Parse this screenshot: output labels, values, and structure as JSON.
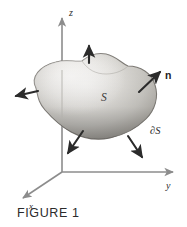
{
  "figure": {
    "caption": "FIGURE 1",
    "background_color": "#ffffff",
    "ink_color": "#2b2b2b",
    "axis_color": "#8c8c8c",
    "surface_fill_light": "#f0efec",
    "surface_fill_mid": "#c9c7c2",
    "surface_fill_dark": "#9a9791",
    "surface_edge": "#7d7a75"
  },
  "axes": {
    "origin": {
      "x": 62,
      "y": 172
    },
    "items": [
      {
        "name": "z-axis",
        "label": "z",
        "label_x": 69,
        "label_y": 13,
        "tip_x": 62,
        "tip_y": 16,
        "italic": true
      },
      {
        "name": "y-axis",
        "label": "y",
        "label_x": 169,
        "label_y": 187,
        "tip_x": 176,
        "tip_y": 172,
        "italic": true
      },
      {
        "name": "x-axis",
        "label": "x",
        "label_x": 31,
        "label_y": 206,
        "tip_x": 20,
        "tip_y": 200,
        "italic": true
      }
    ]
  },
  "surface": {
    "label": "S",
    "label_x": 104,
    "label_y": 97,
    "boundary_label": "∂S",
    "boundary_label_x": 155,
    "boundary_label_y": 130,
    "description": "closed blob surface S with oriented boundary"
  },
  "normal_vectors": {
    "label": "n",
    "label_x": 168,
    "label_y": 75,
    "count": 5,
    "arrows": [
      {
        "name": "normal-arrow-top",
        "x1": 89,
        "y1": 63,
        "x2": 89,
        "y2": 44
      },
      {
        "name": "normal-arrow-left",
        "x1": 38,
        "y1": 91,
        "x2": 13,
        "y2": 97
      },
      {
        "name": "normal-arrow-upper-right",
        "x1": 139,
        "y1": 92,
        "x2": 162,
        "y2": 70
      },
      {
        "name": "normal-arrow-lower-left",
        "x1": 83,
        "y1": 131,
        "x2": 66,
        "y2": 156
      },
      {
        "name": "normal-arrow-lower-right",
        "x1": 128,
        "y1": 136,
        "x2": 144,
        "y2": 160
      }
    ]
  }
}
